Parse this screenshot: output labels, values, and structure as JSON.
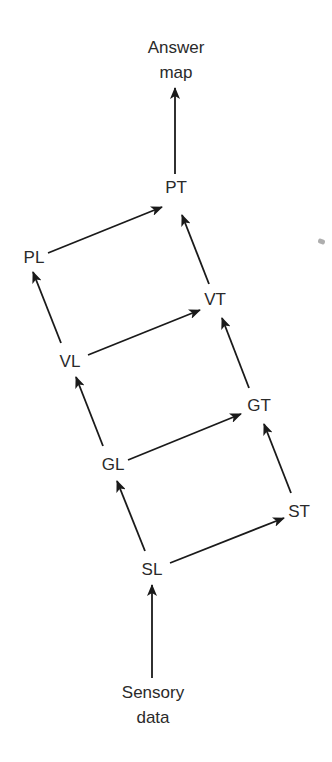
{
  "diagram": {
    "type": "hierarchical flow diagram",
    "top_label": {
      "line1": "Answer",
      "line2": "map"
    },
    "bottom_label": {
      "line1": "Sensory",
      "line2": "data"
    },
    "nodes": {
      "PT": "PT",
      "PL": "PL",
      "VT": "VT",
      "VL": "VL",
      "GT": "GT",
      "GL": "GL",
      "ST": "ST",
      "SL": "SL"
    },
    "edges": [
      {
        "from": "Sensory data",
        "to": "SL"
      },
      {
        "from": "SL",
        "to": "GL"
      },
      {
        "from": "SL",
        "to": "ST"
      },
      {
        "from": "GL",
        "to": "VL"
      },
      {
        "from": "GL",
        "to": "GT"
      },
      {
        "from": "ST",
        "to": "GT"
      },
      {
        "from": "VL",
        "to": "PL"
      },
      {
        "from": "VL",
        "to": "VT"
      },
      {
        "from": "GT",
        "to": "VT"
      },
      {
        "from": "PL",
        "to": "PT"
      },
      {
        "from": "VT",
        "to": "PT"
      },
      {
        "from": "PT",
        "to": "Answer map"
      }
    ],
    "line_color": "#1a1a1a"
  }
}
